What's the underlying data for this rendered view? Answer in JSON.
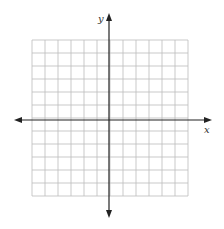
{
  "diagram": {
    "type": "coordinate-grid",
    "grid": {
      "columns": 12,
      "rows": 12,
      "left": 32,
      "top": 40,
      "cell": 13.0,
      "color": "#bbbbbb"
    },
    "axes": {
      "color": "#222222",
      "x_axis": {
        "label": "x",
        "y": 120,
        "from": 14,
        "to": 212
      },
      "y_axis": {
        "label": "y",
        "x": 109,
        "from": 13,
        "to": 218
      }
    }
  }
}
